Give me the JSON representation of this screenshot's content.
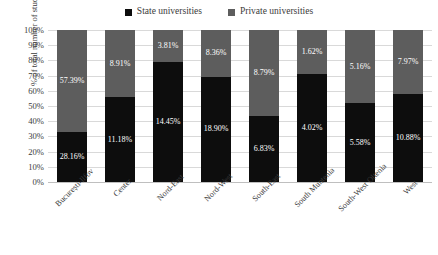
{
  "chart_data": {
    "type": "bar",
    "subtype": "stacked-100-percent",
    "title": "",
    "xlabel": "",
    "ylabel": "% of total number of students",
    "ylim": [
      0,
      100
    ],
    "ytick_labels": [
      "100%",
      "90%",
      "80%",
      "70%",
      "60%",
      "50%",
      "40%",
      "30%",
      "20%",
      "10%",
      "0%"
    ],
    "ytick_values": [
      100,
      90,
      80,
      70,
      60,
      50,
      40,
      30,
      20,
      10,
      0
    ],
    "grid": true,
    "legend_position": "top-center",
    "categories": [
      "București-Ilfov",
      "Center",
      "Nord-East",
      "Nord-West",
      "South-East",
      "South Muntenia",
      "South-West Oltenia",
      "West"
    ],
    "series": [
      {
        "name": "State universities",
        "color": "#0d0d0d",
        "values": [
          28.16,
          11.18,
          14.45,
          18.9,
          6.83,
          4.02,
          5.58,
          10.88
        ],
        "value_labels": [
          "28.16%",
          "11.18%",
          "14.45%",
          "18.90%",
          "6.83%",
          "4.02%",
          "5.58%",
          "10.88%"
        ]
      },
      {
        "name": "Private universities",
        "color": "#5d5d5d",
        "values": [
          57.39,
          8.91,
          3.81,
          8.36,
          8.79,
          1.62,
          5.16,
          7.97
        ],
        "value_labels": [
          "57.39%",
          "8.91%",
          "3.81%",
          "8.36%",
          "8.79%",
          "1.62%",
          "5.16%",
          "7.97%"
        ]
      }
    ],
    "stack_shares_percent": {
      "state": [
        32.9,
        55.6,
        79.1,
        69.3,
        43.7,
        71.3,
        51.9,
        57.7
      ],
      "private": [
        67.1,
        44.4,
        20.9,
        30.7,
        56.3,
        28.7,
        48.1,
        42.3
      ]
    }
  },
  "colors": {
    "state": "#0d0d0d",
    "private": "#5d5d5d",
    "grid": "#d9d9d9",
    "axis": "#bfbfbf",
    "text": "#3b3b3b",
    "label_text": "#ffffff",
    "background": "#ffffff"
  }
}
